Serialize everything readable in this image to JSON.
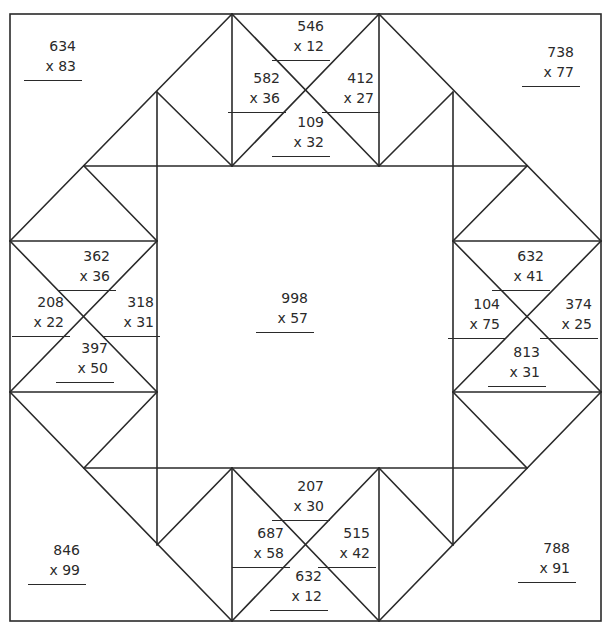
{
  "worksheet": {
    "type": "multiplication-quilt-puzzle",
    "problems": [
      {
        "id": "corner-top-left",
        "top": "634",
        "bottom": "x 83",
        "x": 22,
        "y": 36
      },
      {
        "id": "top-top",
        "top": "546",
        "bottom": "x 12",
        "x": 270,
        "y": 16
      },
      {
        "id": "top-left",
        "top": "582",
        "bottom": "x 36",
        "x": 226,
        "y": 68
      },
      {
        "id": "top-right",
        "top": "412",
        "bottom": "x 27",
        "x": 320,
        "y": 68
      },
      {
        "id": "top-bottom",
        "top": "109",
        "bottom": "x 32",
        "x": 270,
        "y": 112
      },
      {
        "id": "corner-top-right",
        "top": "738",
        "bottom": "x 77",
        "x": 520,
        "y": 42
      },
      {
        "id": "left-top",
        "top": "362",
        "bottom": "x 36",
        "x": 56,
        "y": 246
      },
      {
        "id": "left-left",
        "top": "208",
        "bottom": "x 22",
        "x": 10,
        "y": 292
      },
      {
        "id": "left-right",
        "top": "318",
        "bottom": "x 31",
        "x": 100,
        "y": 292
      },
      {
        "id": "left-bottom",
        "top": "397",
        "bottom": "x 50",
        "x": 54,
        "y": 338
      },
      {
        "id": "center",
        "top": "998",
        "bottom": "x 57",
        "x": 254,
        "y": 288
      },
      {
        "id": "right-top",
        "top": "632",
        "bottom": "x 41",
        "x": 490,
        "y": 246
      },
      {
        "id": "right-left",
        "top": "104",
        "bottom": "x 75",
        "x": 446,
        "y": 294
      },
      {
        "id": "right-right",
        "top": "374",
        "bottom": "x 25",
        "x": 538,
        "y": 294
      },
      {
        "id": "right-bottom",
        "top": "813",
        "bottom": "x 31",
        "x": 486,
        "y": 342
      },
      {
        "id": "bottom-top",
        "top": "207",
        "bottom": "x 30",
        "x": 270,
        "y": 476
      },
      {
        "id": "bottom-left",
        "top": "687",
        "bottom": "x 58",
        "x": 230,
        "y": 523
      },
      {
        "id": "bottom-right",
        "top": "515",
        "bottom": "x 42",
        "x": 316,
        "y": 523
      },
      {
        "id": "bottom-bottom",
        "top": "632",
        "bottom": "x 12",
        "x": 268,
        "y": 566
      },
      {
        "id": "corner-bottom-left",
        "top": "846",
        "bottom": "x 99",
        "x": 26,
        "y": 540
      },
      {
        "id": "corner-bottom-right",
        "top": "788",
        "bottom": "x 91",
        "x": 516,
        "y": 538
      }
    ]
  }
}
